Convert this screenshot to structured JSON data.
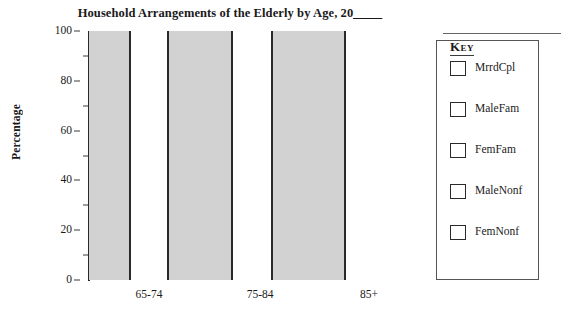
{
  "chart_data": {
    "type": "bar",
    "title": "Household Arrangements of the Elderly by Age, 20",
    "title_blank": "____",
    "xlabel": "",
    "ylabel": "Percentage",
    "ylim": [
      0,
      100
    ],
    "ytick_labels": [
      "0",
      "20",
      "40",
      "60",
      "80",
      "100"
    ],
    "ytick_values": [
      0,
      20,
      40,
      60,
      80,
      100
    ],
    "minor_tick_values": [
      10,
      30,
      50,
      70,
      90
    ],
    "grid": false,
    "stacked": true,
    "stack_total": 100,
    "categories": [
      "65-74",
      "75-84",
      "85+"
    ],
    "legend_position": "right",
    "legend_title": "Key",
    "series": [
      {
        "name": "MrrdCpl",
        "swatch_color": "#ffffff",
        "values": [
          null,
          null,
          null
        ]
      },
      {
        "name": "MaleFam",
        "swatch_color": "#ffffff",
        "values": [
          null,
          null,
          null
        ]
      },
      {
        "name": "FemFam",
        "swatch_color": "#ffffff",
        "values": [
          null,
          null,
          null
        ]
      },
      {
        "name": "MaleNonf",
        "swatch_color": "#ffffff",
        "values": [
          null,
          null,
          null
        ]
      },
      {
        "name": "FemNonf",
        "swatch_color": "#ffffff",
        "values": [
          null,
          null,
          null
        ]
      }
    ],
    "bars": [
      {
        "label": "65-74-left",
        "x_left_pct": 0.0,
        "x_right_pct": 13.2,
        "fill": "#d2d2d2",
        "value": 100
      },
      {
        "label": "65-74-right",
        "x_left_pct": 13.2,
        "x_right_pct": 25.4,
        "fill": "#ffffff",
        "value": 100
      },
      {
        "label": "75-84-left",
        "x_left_pct": 25.4,
        "x_right_pct": 46.0,
        "fill": "#d2d2d2",
        "value": 100
      },
      {
        "label": "75-84-right",
        "x_left_pct": 46.0,
        "x_right_pct": 58.8,
        "fill": "#ffffff",
        "value": 100
      },
      {
        "label": "85-left",
        "x_left_pct": 58.8,
        "x_right_pct": 82.3,
        "fill": "#d2d2d2",
        "value": 100
      },
      {
        "label": "85-right",
        "x_left_pct": 82.3,
        "x_right_pct": 100.0,
        "fill": "#ffffff",
        "value": 100
      }
    ],
    "category_label_positions_pct": [
      19.3,
      55.0,
      90.0
    ]
  },
  "colors": {
    "bar_gray": "#d2d2d2",
    "bar_white": "#ffffff",
    "outline": "#2a2a2a",
    "text": "#1a1a1a",
    "legend_border": "#555555"
  }
}
